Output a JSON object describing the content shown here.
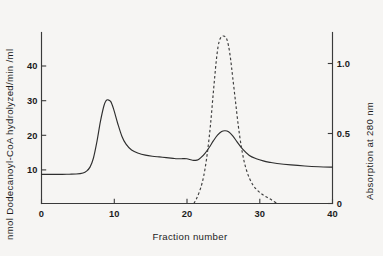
{
  "chart_data": {
    "type": "line",
    "title": "",
    "xlabel": "Fraction number",
    "ylabel": "nmol Dodecanoyl-CoA hydrolyzed/min /ml",
    "ylabel_right": "Absorption at 280 nm",
    "xlim": [
      0,
      42
    ],
    "ylim": [
      0,
      47
    ],
    "ylim_right": [
      0,
      1.14
    ],
    "grid": false,
    "legend": "none",
    "xticks": [
      0,
      10,
      20,
      30,
      40
    ],
    "xtick_labels": [
      "0",
      "10",
      "20",
      "30",
      "40"
    ],
    "yticks": [
      10,
      20,
      30,
      40
    ],
    "ytick_labels": [
      "10",
      "20",
      "30",
      "40"
    ],
    "yticks_right": [
      0,
      0.5,
      1.0
    ],
    "ytick_labels_right": [
      "0",
      "0.5",
      "1.0"
    ],
    "series": [
      {
        "name": "Dodecanoyl-CoA hydrolase activity",
        "axis": "left",
        "style": "solid",
        "color": "#2e2e2e",
        "x": [
          0,
          1,
          2,
          3,
          4,
          5,
          6,
          6.5,
          7,
          7.5,
          8,
          8.5,
          9,
          9.3,
          9.6,
          10,
          10.4,
          11,
          11.6,
          12.2,
          13,
          14,
          15,
          16,
          17,
          18,
          19,
          19.6,
          20.2,
          20.6,
          21,
          21.4,
          21.8,
          22.2,
          22.6,
          23,
          23.6,
          24.2,
          24.8,
          25.4,
          26,
          26.5,
          27,
          27.6,
          28.2,
          29,
          30,
          31,
          32,
          33,
          34,
          36,
          38,
          40,
          42
        ],
        "y": [
          8.0,
          8.0,
          8.0,
          8.0,
          8.05,
          8.1,
          8.4,
          8.9,
          10.0,
          12.5,
          17.0,
          22.5,
          26.8,
          28.2,
          28.5,
          28.0,
          26.0,
          22.0,
          18.5,
          16.3,
          14.7,
          13.8,
          13.3,
          13.0,
          12.8,
          12.6,
          12.4,
          12.3,
          12.3,
          12.35,
          12.3,
          12.1,
          11.9,
          11.85,
          12.0,
          12.6,
          13.8,
          15.4,
          17.2,
          18.8,
          19.8,
          20.0,
          19.7,
          18.6,
          17.0,
          15.0,
          13.2,
          12.3,
          11.7,
          11.3,
          11.0,
          10.6,
          10.3,
          10.1,
          10.0
        ]
      },
      {
        "name": "Absorption at 280 nm",
        "axis": "right",
        "style": "dashed",
        "color": "#3c3c3c",
        "x": [
          22.0,
          22.4,
          22.8,
          23.2,
          23.6,
          24.0,
          24.4,
          24.8,
          25.2,
          25.5,
          25.8,
          26.1,
          26.4,
          26.7,
          27.0,
          27.3,
          27.6,
          28.0,
          28.4,
          28.8,
          29.2,
          29.6,
          30.0,
          30.5,
          31.0,
          31.6,
          32.2,
          32.8,
          33.4,
          34.0
        ],
        "y": [
          0.0,
          0.035,
          0.08,
          0.14,
          0.23,
          0.36,
          0.53,
          0.74,
          0.94,
          1.05,
          1.1,
          1.115,
          1.115,
          1.1,
          1.05,
          0.96,
          0.84,
          0.68,
          0.52,
          0.39,
          0.29,
          0.22,
          0.17,
          0.125,
          0.095,
          0.07,
          0.05,
          0.035,
          0.018,
          0.0
        ]
      }
    ]
  }
}
